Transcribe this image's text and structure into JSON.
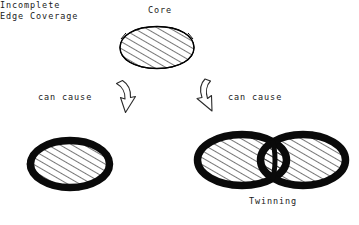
{
  "diagram": {
    "title_node": {
      "label": "Core"
    },
    "connectors": [
      {
        "name": "arrow-left",
        "label": "can cause",
        "direction": "down-left"
      },
      {
        "name": "arrow-right",
        "label": "can cause",
        "direction": "down-right"
      }
    ],
    "outcomes": [
      {
        "name": "incomplete-edge-coverage",
        "label_line1": "Incomplete",
        "label_line2": "Edge Coverage"
      },
      {
        "name": "twinning",
        "label": "Twinning"
      }
    ],
    "colors": {
      "background": "#ffffff",
      "ink": "#000000",
      "text": "#1a1a1a",
      "ring": "#0a0a0a",
      "hatch": "#111111"
    },
    "style": {
      "hatch_angle_deg": 60,
      "hatch_spacing_px": 6,
      "core_outline_width_px": 1.2,
      "ring_width_px": 7
    }
  }
}
